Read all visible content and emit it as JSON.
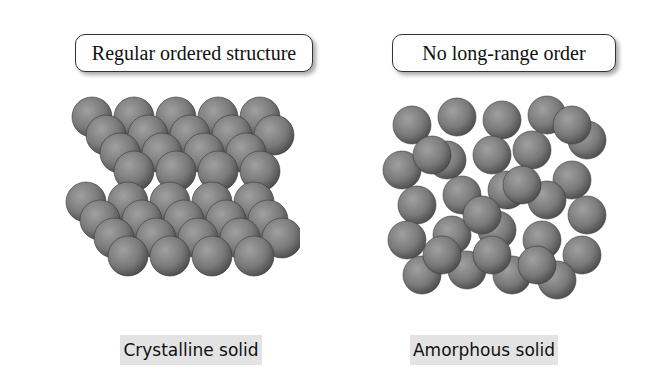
{
  "left_panel": {
    "callout": "Regular ordered structure",
    "label": "Crystalline solid"
  },
  "right_panel": {
    "callout": "No long-range order",
    "label": "Amorphous solid"
  },
  "colors": {
    "sphere": "#7a7a7a",
    "label_bg": "#e3e3e3",
    "border": "#333333"
  }
}
